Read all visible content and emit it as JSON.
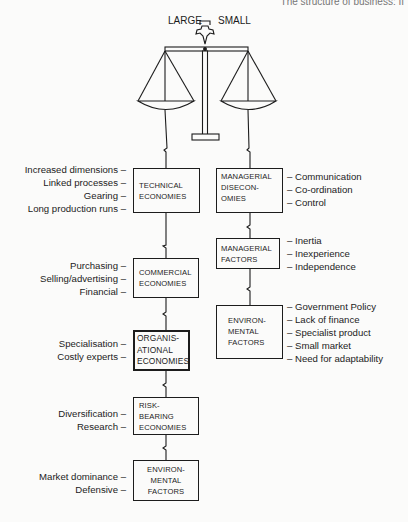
{
  "header": {
    "text": "The structure of business: II"
  },
  "scale": {
    "left_label": "LARGE",
    "right_label": "SMALL"
  },
  "left_column": [
    {
      "id": "technical",
      "title_lines": [
        "TECHNICAL",
        "ECONOMIES"
      ],
      "items": [
        "Increased dimensions",
        "Linked processes",
        "Gearing",
        "Long production runs"
      ]
    },
    {
      "id": "commercial",
      "title_lines": [
        "COMMERCIAL",
        "ECONOMIES"
      ],
      "items": [
        "Purchasing",
        "Selling/advertising",
        "Financial"
      ]
    },
    {
      "id": "organisational",
      "title_lines": [
        "ORGANIS-",
        "ATIONAL",
        "ECONOMIES"
      ],
      "items": [
        "Specialisation",
        "Costly experts"
      ]
    },
    {
      "id": "risk-bearing",
      "title_lines": [
        "RISK-",
        "BEARING",
        "ECONOMIES"
      ],
      "items": [
        "Diversification",
        "Research"
      ]
    },
    {
      "id": "environmental-left",
      "title_lines": [
        "ENVIRON-",
        "MENTAL",
        "FACTORS"
      ],
      "items": [
        "Market dominance",
        "Defensive"
      ]
    }
  ],
  "right_column": [
    {
      "id": "managerial-diseconomies",
      "title_lines": [
        "MANAGERIAL",
        "DISECON-",
        "OMIES"
      ],
      "items": [
        "Communication",
        "Co-ordination",
        "Control"
      ]
    },
    {
      "id": "managerial-factors",
      "title_lines": [
        "MANAGERIAL",
        "FACTORS"
      ],
      "items": [
        "Inertia",
        "Inexperience",
        "Independence"
      ]
    },
    {
      "id": "environmental-right",
      "title_lines": [
        "ENVIRON-",
        "MENTAL",
        "FACTORS"
      ],
      "items": [
        "Government Policy",
        "Lack of finance",
        "Specialist product",
        "Small market",
        "Need for adaptability"
      ]
    }
  ],
  "dash": "–"
}
